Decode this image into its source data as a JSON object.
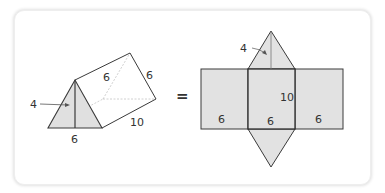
{
  "figure": {
    "equals_sign": "=",
    "prism": {
      "height_label": "4",
      "base_label": "6",
      "side_label_top": "6",
      "side_label_right": "6",
      "length_label": "10"
    },
    "net": {
      "height_label": "4",
      "length_label": "10",
      "width_labels": [
        "6",
        "6",
        "6"
      ]
    },
    "colors": {
      "stroke": "#3a3a3a",
      "fill": "#e2e2e2",
      "hidden_line": "#bdbdbd",
      "card_border": "#e0e0e0"
    }
  }
}
